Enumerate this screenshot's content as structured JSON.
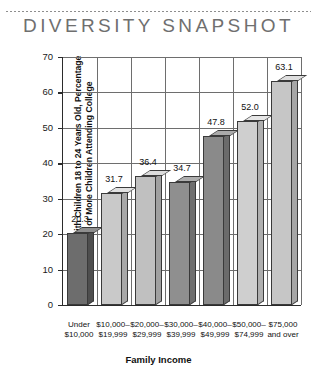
{
  "header": {
    "title": "DIVERSITY SNAPSHOT",
    "rule": "dotted-rule"
  },
  "chart_data": {
    "type": "bar",
    "title": "DIVERSITY SNAPSHOT",
    "subtitle": "",
    "xlabel": "Family Income",
    "ylabel": "For Families with Children 18 to 24 Years Old, Percentage with One or More Children Attending College",
    "ylabel_line1": "For Families with Children 18 to 24 Years Old, Percentage",
    "ylabel_line2": "with One or More Children Attending College",
    "categories": [
      "Under\n$10,000",
      "$10,000–\n$19,999",
      "$20,000–\n$29,999",
      "$30,000–\n$39,999",
      "$40,000–\n$49,999",
      "$50,000–\n$74,999",
      "$75,000\nand over"
    ],
    "category_lines": [
      [
        "Under",
        "$10,000"
      ],
      [
        "$10,000–",
        "$19,999"
      ],
      [
        "$20,000–",
        "$29,999"
      ],
      [
        "$30,000–",
        "$39,999"
      ],
      [
        "$40,000–",
        "$49,999"
      ],
      [
        "$50,000–",
        "$74,999"
      ],
      [
        "$75,000",
        "and over"
      ]
    ],
    "values": [
      20.3,
      31.7,
      36.4,
      34.7,
      47.8,
      52.0,
      63.1
    ],
    "value_labels": [
      "20.3",
      "31.7",
      "36.4",
      "34.7",
      "47.8",
      "52.0",
      "63.1"
    ],
    "bar_colors": [
      "#6d6d6d",
      "#c9c9c9",
      "#c0c0c0",
      "#8f8f8f",
      "#8a8a8a",
      "#cfcfcf",
      "#c6c6c6"
    ],
    "bar_top_colors": [
      "#8f8f8f",
      "#e2e2e2",
      "#dcdcdc",
      "#aeaeae",
      "#aaaaaa",
      "#e6e6e6",
      "#dedede"
    ],
    "bar_side_colors": [
      "#4e4e4e",
      "#a8a8a8",
      "#a0a0a0",
      "#6f6f6f",
      "#6b6b6b",
      "#afafaf",
      "#a6a6a6"
    ],
    "ylim": [
      0,
      70
    ],
    "ytick_step": 10,
    "yticks": [
      "0",
      "10",
      "20",
      "30",
      "40",
      "50",
      "60",
      "70"
    ],
    "grid": "horizontal and vertical gridlines",
    "legend": "none",
    "style": "3d-bar"
  }
}
